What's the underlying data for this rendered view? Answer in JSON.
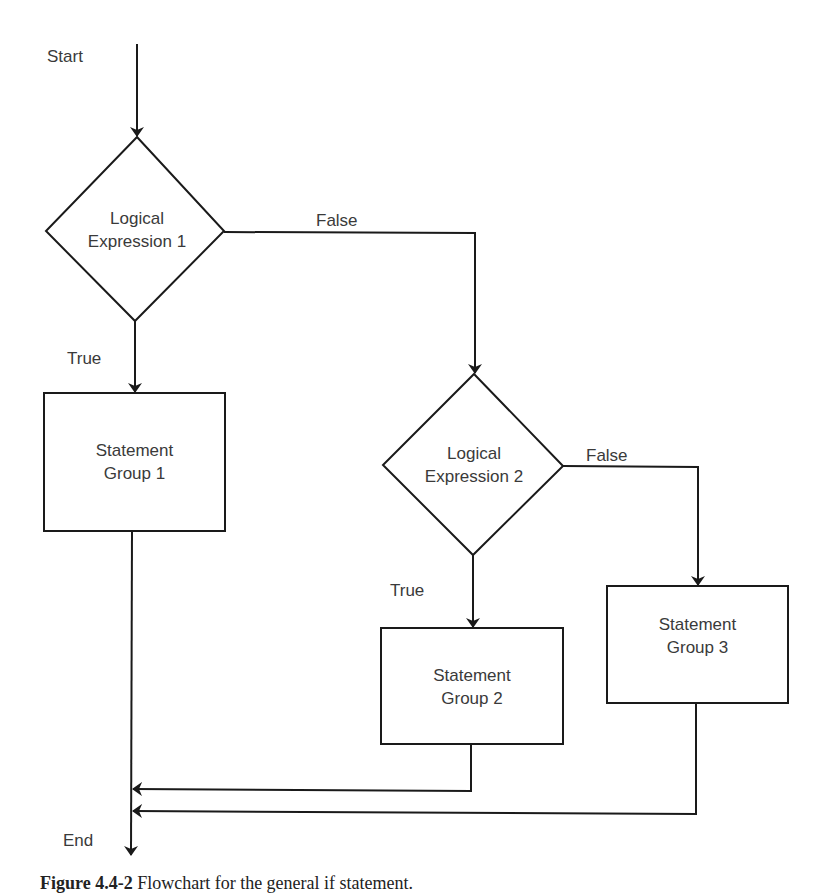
{
  "diagram": {
    "type": "flowchart",
    "start_label": "Start",
    "end_label": "End",
    "nodes": [
      {
        "id": "d1",
        "kind": "decision",
        "line1": "Logical",
        "line2": "Expression 1"
      },
      {
        "id": "s1",
        "kind": "process",
        "line1": "Statement",
        "line2": "Group 1"
      },
      {
        "id": "d2",
        "kind": "decision",
        "line1": "Logical",
        "line2": "Expression 2"
      },
      {
        "id": "s2",
        "kind": "process",
        "line1": "Statement",
        "line2": "Group 2"
      },
      {
        "id": "s3",
        "kind": "process",
        "line1": "Statement",
        "line2": "Group 3"
      }
    ],
    "edges": [
      {
        "from": "start",
        "to": "d1",
        "label": ""
      },
      {
        "from": "d1",
        "to": "s1",
        "label": "True"
      },
      {
        "from": "d1",
        "to": "d2",
        "label": "False"
      },
      {
        "from": "d2",
        "to": "s2",
        "label": "True"
      },
      {
        "from": "d2",
        "to": "s3",
        "label": "False"
      },
      {
        "from": "s1",
        "to": "end",
        "label": ""
      },
      {
        "from": "s2",
        "to": "end",
        "label": ""
      },
      {
        "from": "s3",
        "to": "end",
        "label": ""
      }
    ],
    "line_color": "#1a1a1a",
    "text_color": "#3a3a3a"
  },
  "caption": {
    "figure_label": "Figure 4.4-2",
    "text": "Flowchart for the general if statement."
  }
}
